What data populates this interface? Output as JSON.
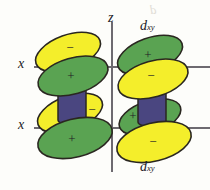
{
  "figure": {
    "kind": "orbital-diagram",
    "title_top": "d",
    "title_top_sub": "xy",
    "title_bottom": "d",
    "title_bottom_sub": "xy",
    "background_color": "#fdfdfa",
    "ink_color": "#232026"
  },
  "axes": {
    "vertical": {
      "label": "z",
      "x": 112,
      "y_top": 22,
      "y_bottom": 172
    },
    "horizontal": [
      {
        "label": "x",
        "y": 67,
        "x_left": 34,
        "x_right": 210
      },
      {
        "label": "x",
        "y": 128,
        "x_left": 34,
        "x_right": 210
      }
    ],
    "axis_color": "#6d6a70",
    "axis_width": 2
  },
  "colors": {
    "positive_lobe": "#5aa352",
    "negative_lobe": "#f4ee2b",
    "cylinder": "#4a4680",
    "outline": "#2a2720"
  },
  "legend": {
    "positive_sign": "+",
    "negative_sign": "−"
  },
  "orbitals": [
    {
      "name": "upper-left-orbital",
      "cylinder": {
        "cx": 72,
        "cy": 98,
        "w": 28,
        "h": 40
      },
      "lobes": [
        {
          "name": "upper-left-negative-lobe",
          "sign": "−",
          "fill": "#f4ee2b",
          "cx": 68,
          "cy": 52,
          "rx": 34,
          "ry": 17,
          "rot": -20
        },
        {
          "name": "upper-left-positive-lobe",
          "sign": "+",
          "fill": "#5aa352",
          "cx": 73,
          "cy": 76,
          "rx": 36,
          "ry": 18,
          "rot": -16
        }
      ]
    },
    {
      "name": "upper-right-orbital",
      "cylinder": {
        "cx": 152,
        "cy": 98,
        "w": 28,
        "h": 40
      },
      "lobes": [
        {
          "name": "upper-right-positive-lobe",
          "sign": "+",
          "fill": "#5aa352",
          "cx": 150,
          "cy": 55,
          "rx": 34,
          "ry": 17,
          "rot": -20
        },
        {
          "name": "upper-right-negative-lobe",
          "sign": "−",
          "fill": "#f4ee2b",
          "cx": 153,
          "cy": 79,
          "rx": 36,
          "ry": 18,
          "rot": -16
        }
      ]
    },
    {
      "name": "lower-left-orbital",
      "cylinder": {
        "cx": 72,
        "cy": 98,
        "w": 28,
        "h": 40
      },
      "lobes": [
        {
          "name": "lower-left-negative-lobe",
          "sign": "−",
          "fill": "#f4ee2b",
          "cx": 70,
          "cy": 113,
          "rx": 34,
          "ry": 17,
          "rot": -20
        },
        {
          "name": "lower-left-positive-lobe",
          "sign": "+",
          "fill": "#5aa352",
          "cx": 75,
          "cy": 138,
          "rx": 38,
          "ry": 19,
          "rot": -14
        }
      ]
    },
    {
      "name": "lower-right-orbital",
      "cylinder": {
        "cx": 152,
        "cy": 98,
        "w": 28,
        "h": 40
      },
      "lobes": [
        {
          "name": "lower-right-positive-lobe",
          "sign": "+",
          "fill": "#5aa352",
          "cx": 150,
          "cy": 117,
          "rx": 32,
          "ry": 16,
          "rot": -18
        },
        {
          "name": "lower-right-negative-lobe",
          "sign": "−",
          "fill": "#f4ee2b",
          "cx": 154,
          "cy": 142,
          "rx": 38,
          "ry": 19,
          "rot": -14
        }
      ]
    }
  ],
  "ghost_marks": {
    "a": "d",
    "b": "",
    "c": ""
  }
}
